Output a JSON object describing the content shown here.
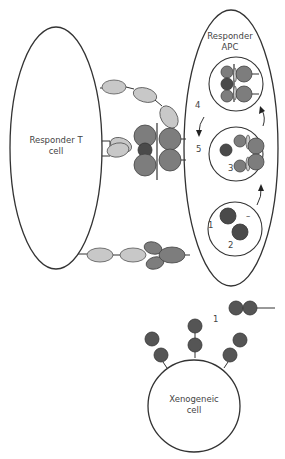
{
  "diagram": {
    "cells": {
      "t_cell": {
        "label_line1": "Responder T",
        "label_line2": "cell"
      },
      "apc": {
        "label_line1": "Responder",
        "label_line2": "APC"
      },
      "xeno": {
        "label_line1": "Xenogeneic",
        "label_line2": "cell"
      }
    },
    "steps": {
      "apc_step1": "1",
      "apc_step2": "2",
      "apc_step3": "3",
      "apc_step4": "4",
      "apc_step5": "5",
      "shed_step1": "1",
      "minus_sign": "–"
    },
    "colors": {
      "light_molecule": "#c8c8c8",
      "mid_molecule": "#7d7d7d",
      "dark_molecule": "#4a4a4a",
      "outline": "#333333"
    }
  }
}
